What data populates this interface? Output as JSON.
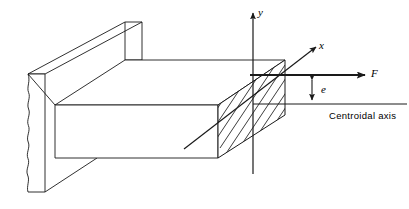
{
  "figure": {
    "type": "engineering-mechanics-diagram",
    "stroke_color": "#1a1a1a",
    "fill_color": "#ffffff",
    "background": "#ffffff"
  },
  "labels": {
    "axis_y": "y",
    "axis_x": "x",
    "force": "F",
    "eccentricity": "e",
    "centroidal_axis": "Centroidal axis"
  },
  "annotations": {
    "y_axis_name": "vertical-axis",
    "x_axis_name": "depth-axis",
    "force_name": "applied-force",
    "eccentricity_name": "eccentricity-dimension",
    "centroidal_name": "centroidal-axis-reference-line"
  },
  "geometry": {
    "wall": {
      "name": "fixed-support-wall",
      "front_face": [
        [
          28,
          74
        ],
        [
          45,
          74
        ],
        [
          45,
          192
        ],
        [
          28,
          192
        ]
      ],
      "top_face": [
        [
          28,
          74
        ],
        [
          125,
          22
        ],
        [
          142,
          22
        ],
        [
          45,
          74
        ]
      ],
      "broken_edge": "jagged"
    },
    "beam": {
      "name": "cantilever-beam",
      "top_face": [
        [
          55,
          105
        ],
        [
          125,
          60
        ],
        [
          285,
          60
        ],
        [
          218,
          105
        ]
      ],
      "front_face": [
        [
          55,
          105
        ],
        [
          218,
          105
        ],
        [
          218,
          158
        ],
        [
          55,
          158
        ]
      ],
      "end_section_hatched": true
    },
    "cross_section": {
      "name": "hatched-cross-section",
      "vertices": [
        [
          218,
          105
        ],
        [
          285,
          60
        ],
        [
          285,
          115
        ],
        [
          218,
          158
        ]
      ],
      "hatch_angle_deg": 38,
      "hatch_spacing_px": 4.5
    },
    "axes": {
      "y_axis": {
        "from": [
          253,
          175
        ],
        "to": [
          253,
          10
        ],
        "arrow": "up"
      },
      "x_axis": {
        "from": [
          185,
          148
        ],
        "to": [
          318,
          46
        ],
        "arrow": "up-right"
      }
    },
    "force_vector": {
      "from": [
        253,
        75
      ],
      "to": [
        366,
        75
      ],
      "arrow": "right"
    },
    "eccentricity_dim": {
      "from": [
        312,
        76
      ],
      "to": [
        312,
        104
      ],
      "arrows": "both"
    },
    "centroidal_line": {
      "from": [
        253,
        104
      ],
      "to": [
        406,
        104
      ]
    }
  }
}
